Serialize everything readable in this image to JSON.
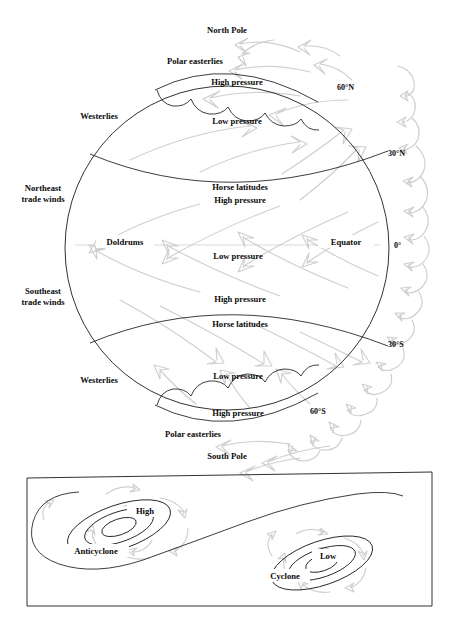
{
  "figure": {
    "title_semantic": "global-atmospheric-circulation-diagram",
    "globe": {
      "poles": {
        "north": "North Pole",
        "south": "South Pole"
      },
      "latitude_labels": [
        {
          "id": "lat-60n",
          "text": "60°N"
        },
        {
          "id": "lat-30n",
          "text": "30°N"
        },
        {
          "id": "lat-0",
          "text": "0°"
        },
        {
          "id": "lat-30s",
          "text": "30°S"
        },
        {
          "id": "lat-60s",
          "text": "60°S"
        }
      ],
      "equator_label": "Equator",
      "wind_belts": [
        {
          "id": "polar-easterlies-north",
          "text": "Polar easterlies"
        },
        {
          "id": "westerlies-north",
          "text": "Westerlies"
        },
        {
          "id": "northeast-trade-winds",
          "line1": "Northeast",
          "line2": "trade winds"
        },
        {
          "id": "southeast-trade-winds",
          "line1": "Southeast",
          "line2": "trade winds"
        },
        {
          "id": "westerlies-south",
          "text": "Westerlies"
        },
        {
          "id": "polar-easterlies-south",
          "text": "Polar easterlies"
        }
      ],
      "pressure_bands": [
        {
          "id": "high-pressure-polar-north",
          "text": "High pressure"
        },
        {
          "id": "low-pressure-subpolar-north",
          "text": "Low pressure"
        },
        {
          "id": "horse-latitudes-north",
          "text": "Horse latitudes"
        },
        {
          "id": "high-pressure-subtropical-north",
          "text": "High pressure"
        },
        {
          "id": "doldrums",
          "text": "Doldrums"
        },
        {
          "id": "low-pressure-equatorial",
          "text": "Low pressure"
        },
        {
          "id": "high-pressure-subtropical-south",
          "text": "High pressure"
        },
        {
          "id": "horse-latitudes-south",
          "text": "Horse latitudes"
        },
        {
          "id": "low-pressure-subpolar-south",
          "text": "Low pressure"
        },
        {
          "id": "high-pressure-polar-south",
          "text": "High pressure"
        }
      ]
    },
    "panel": {
      "id": "cyclone-anticyclone-panel",
      "systems": [
        {
          "id": "anticyclone",
          "center_label": "High",
          "name_label": "Anticyclone"
        },
        {
          "id": "cyclone",
          "center_label": "Low",
          "name_label": "Cyclone"
        }
      ]
    },
    "colors": {
      "ink": "#1b1b1b",
      "arrow_gray": "#cfcfcf",
      "equator_gray": "#c9c9c9",
      "background": "#ffffff"
    }
  }
}
